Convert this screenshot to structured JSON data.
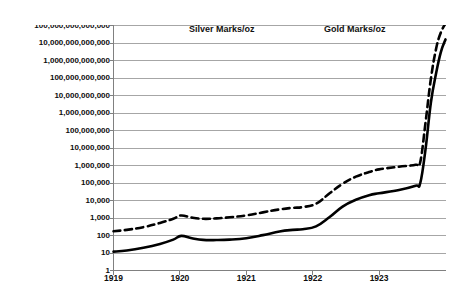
{
  "chart_data": {
    "type": "line",
    "title": "",
    "ylabel": "Marks / oz",
    "xlabel": "",
    "log_y": true,
    "ylim": [
      1,
      100000000000000
    ],
    "grid": true,
    "legend_position": "top-center",
    "x": [
      1919,
      1920,
      1921,
      1922,
      1923,
      1924
    ],
    "xtick_labels": [
      "1919",
      "1920",
      "1921",
      "1922",
      "1923"
    ],
    "ytick_labels": [
      "1",
      "10",
      "100",
      "1,000",
      "10,000",
      "100,000",
      "1,000,000",
      "10,000,000",
      "100,000,000",
      "1,000,000,000",
      "10,000,000,000",
      "100,000,000,000",
      "1,000,000,000,000",
      "10,000,000,000,000",
      "100,000,000,000,000"
    ],
    "ytick_values": [
      1,
      10,
      100,
      1000,
      10000,
      100000,
      1000000,
      10000000,
      100000000,
      1000000000,
      10000000000,
      100000000000,
      1000000000000,
      10000000000000,
      100000000000000
    ],
    "series": [
      {
        "name": "Silver Marks/oz",
        "style": "solid",
        "color": "#000000",
        "points": [
          {
            "x": 1919.0,
            "y": 12
          },
          {
            "x": 1919.2,
            "y": 14
          },
          {
            "x": 1919.45,
            "y": 20
          },
          {
            "x": 1919.7,
            "y": 33
          },
          {
            "x": 1919.9,
            "y": 58
          },
          {
            "x": 1920.02,
            "y": 95
          },
          {
            "x": 1920.18,
            "y": 70
          },
          {
            "x": 1920.35,
            "y": 56
          },
          {
            "x": 1920.55,
            "y": 55
          },
          {
            "x": 1920.75,
            "y": 58
          },
          {
            "x": 1921.0,
            "y": 70
          },
          {
            "x": 1921.25,
            "y": 105
          },
          {
            "x": 1921.5,
            "y": 170
          },
          {
            "x": 1921.7,
            "y": 210
          },
          {
            "x": 1921.85,
            "y": 230
          },
          {
            "x": 1922.05,
            "y": 330
          },
          {
            "x": 1922.25,
            "y": 1100
          },
          {
            "x": 1922.45,
            "y": 4500
          },
          {
            "x": 1922.65,
            "y": 11000
          },
          {
            "x": 1922.85,
            "y": 20000
          },
          {
            "x": 1923.0,
            "y": 26000
          },
          {
            "x": 1923.3,
            "y": 40000
          },
          {
            "x": 1923.55,
            "y": 70000
          },
          {
            "x": 1923.62,
            "y": 100000
          },
          {
            "x": 1923.7,
            "y": 9000000
          },
          {
            "x": 1923.78,
            "y": 4000000000
          },
          {
            "x": 1923.86,
            "y": 200000000000
          },
          {
            "x": 1923.93,
            "y": 3000000000000
          },
          {
            "x": 1924.0,
            "y": 16000000000000
          }
        ]
      },
      {
        "name": "Gold Marks/oz",
        "style": "dashed",
        "color": "#000000",
        "points": [
          {
            "x": 1919.0,
            "y": 175
          },
          {
            "x": 1919.2,
            "y": 210
          },
          {
            "x": 1919.45,
            "y": 300
          },
          {
            "x": 1919.7,
            "y": 520
          },
          {
            "x": 1919.9,
            "y": 900
          },
          {
            "x": 1920.02,
            "y": 1400
          },
          {
            "x": 1920.18,
            "y": 1050
          },
          {
            "x": 1920.35,
            "y": 900
          },
          {
            "x": 1920.55,
            "y": 950
          },
          {
            "x": 1920.75,
            "y": 1100
          },
          {
            "x": 1921.0,
            "y": 1400
          },
          {
            "x": 1921.25,
            "y": 2100
          },
          {
            "x": 1921.5,
            "y": 3100
          },
          {
            "x": 1921.7,
            "y": 3800
          },
          {
            "x": 1921.85,
            "y": 4200
          },
          {
            "x": 1922.05,
            "y": 6500
          },
          {
            "x": 1922.25,
            "y": 25000
          },
          {
            "x": 1922.45,
            "y": 90000
          },
          {
            "x": 1922.65,
            "y": 230000
          },
          {
            "x": 1922.85,
            "y": 420000
          },
          {
            "x": 1923.0,
            "y": 600000
          },
          {
            "x": 1923.3,
            "y": 850000
          },
          {
            "x": 1923.55,
            "y": 1100000
          },
          {
            "x": 1923.62,
            "y": 1600000
          },
          {
            "x": 1923.7,
            "y": 300000000
          },
          {
            "x": 1923.78,
            "y": 90000000000
          },
          {
            "x": 1923.86,
            "y": 5000000000000
          },
          {
            "x": 1923.93,
            "y": 40000000000000
          },
          {
            "x": 1924.0,
            "y": 130000000000000
          }
        ]
      }
    ]
  },
  "legend": {
    "silver_label": "Silver Marks/oz",
    "gold_label": "Gold Marks/oz"
  },
  "colors": {
    "line": "#000000",
    "gridline": "#a6a6a6",
    "axis": "#808080",
    "text": "#0d0d0d",
    "background": "#ffffff"
  }
}
